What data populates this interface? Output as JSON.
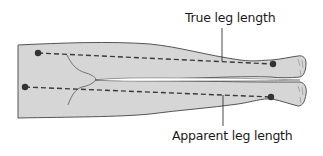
{
  "diagram": {
    "labels": {
      "true_leg_length": "True leg length",
      "apparent_leg_length": "Apparent leg length"
    },
    "colors": {
      "body_fill": "#d6d6d6",
      "outline": "#555555",
      "dashed_line": "#3a3a3a",
      "landmark_dot": "#333333",
      "background": "#ffffff"
    },
    "landmarks": [
      {
        "name": "anterior-superior-iliac-spine",
        "x": 38,
        "y": 53
      },
      {
        "name": "medial-malleolus-upper",
        "x": 273,
        "y": 64
      },
      {
        "name": "umbilicus-or-xiphisternum",
        "x": 25,
        "y": 87
      },
      {
        "name": "medial-malleolus-lower",
        "x": 271,
        "y": 97
      }
    ]
  }
}
